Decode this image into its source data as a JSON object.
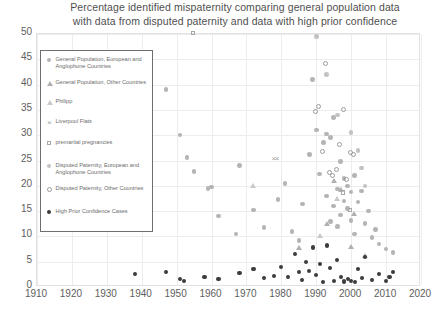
{
  "chart_data": {
    "type": "scatter",
    "title": "Percentage identified mispaternity comparing general population data with data from disputed paternity and data with high prior confidence",
    "title_line1": "Percentage identified mispaternity comparing general population data",
    "title_line2": "with data from disputed paternity and data with high prior confidence",
    "xlabel": "",
    "ylabel": "",
    "xlim": [
      1910,
      2020
    ],
    "ylim": [
      0,
      50
    ],
    "xticks": [
      1910,
      1920,
      1930,
      1940,
      1950,
      1960,
      1970,
      1980,
      1990,
      2000,
      2010,
      2020
    ],
    "yticks": [
      0,
      5,
      10,
      15,
      20,
      25,
      30,
      35,
      40,
      45,
      50
    ],
    "grid": true,
    "legend_position": "upper-left-inside",
    "series": [
      {
        "name": "General Population, European and Anglophone Countries",
        "marker": "filled-circle",
        "color": "#b4b4b4",
        "points": [
          [
            1947,
            39.0
          ],
          [
            1951,
            30.0
          ],
          [
            1953,
            25.6
          ],
          [
            1955,
            22.8
          ],
          [
            1959,
            19.5
          ],
          [
            1960,
            19.8
          ],
          [
            1962,
            14.0
          ],
          [
            1967,
            10.5
          ],
          [
            1968,
            24.0
          ],
          [
            1972,
            15.2
          ],
          [
            1975,
            11.8
          ],
          [
            1979,
            17.3
          ],
          [
            1981,
            20.4
          ],
          [
            1983,
            11.0
          ],
          [
            1985,
            9.2
          ],
          [
            1986,
            16.4
          ],
          [
            1988,
            26.2
          ],
          [
            1989,
            41.0
          ],
          [
            1990,
            31.0
          ],
          [
            1991,
            22.3
          ],
          [
            1992,
            28.5
          ],
          [
            1993,
            30.2
          ],
          [
            1993,
            18.0
          ],
          [
            1994,
            29.5
          ],
          [
            1994,
            13.0
          ],
          [
            1995,
            33.5
          ],
          [
            1995,
            16.0
          ],
          [
            1996,
            19.4
          ],
          [
            1996,
            12.0
          ],
          [
            1997,
            24.8
          ],
          [
            1997,
            14.2
          ],
          [
            1998,
            21.5
          ],
          [
            1998,
            17.0
          ],
          [
            1999,
            20.0
          ],
          [
            1999,
            15.5
          ],
          [
            2000,
            18.8
          ],
          [
            2000,
            13.2
          ],
          [
            2001,
            22.0
          ],
          [
            2001,
            10.5
          ],
          [
            2002,
            16.8
          ],
          [
            2003,
            19.0
          ],
          [
            2004,
            12.5
          ],
          [
            2005,
            15.0
          ],
          [
            2006,
            9.8
          ],
          [
            2007,
            11.4
          ],
          [
            2008,
            8.5
          ],
          [
            2010,
            7.5
          ],
          [
            2012,
            6.8
          ]
        ]
      },
      {
        "name": "General Population, Other Countries",
        "marker": "filled-triangle",
        "color": "#b0b0b0",
        "points": [
          [
            1985,
            7.8
          ],
          [
            1993,
            12.5
          ],
          [
            1995,
            21.0
          ],
          [
            1997,
            19.2
          ],
          [
            2000,
            8.0
          ],
          [
            2001,
            14.5
          ],
          [
            2004,
            6.2
          ]
        ]
      },
      {
        "name": "Philipp",
        "marker": "open-triangle",
        "color": "#c9c9c9",
        "points": [
          [
            1972,
            20.0
          ],
          [
            1991,
            10.2
          ],
          [
            1996,
            17.5
          ]
        ]
      },
      {
        "name": "Liverpool Flats",
        "marker": "x",
        "color": "#9e9e9e",
        "points": [
          [
            1978,
            25.2
          ],
          [
            1979,
            25.2
          ]
        ]
      },
      {
        "name": "premarital pregnancies",
        "marker": "open-square",
        "color": "#a8a8a8",
        "points": [
          [
            1955,
            50.0
          ],
          [
            1998,
            18.5
          ],
          [
            2000,
            15.0
          ]
        ]
      },
      {
        "name": "Disputed Paternity, European and Anglophone Countries",
        "marker": "filled-circle-light",
        "color": "#c2c2c2",
        "points": [
          [
            1990,
            49.5
          ],
          [
            1993,
            42.0
          ],
          [
            1996,
            34.0
          ],
          [
            2000,
            30.5
          ],
          [
            2002,
            27.0
          ],
          [
            2003,
            23.5
          ],
          [
            2004,
            20.0
          ]
        ]
      },
      {
        "name": "Disputed Paternity, Other Countries",
        "marker": "open-circle",
        "color": "#9a9a9a",
        "points": [
          [
            1993,
            44.0
          ],
          [
            1991,
            35.5
          ],
          [
            1990,
            34.5
          ],
          [
            1998,
            34.8
          ],
          [
            1997,
            28.0
          ],
          [
            1996,
            23.0
          ],
          [
            1994,
            22.5
          ],
          [
            1999,
            21.0
          ],
          [
            1992,
            26.5
          ],
          [
            2001,
            26.0
          ],
          [
            2000,
            26.4
          ],
          [
            1995,
            21.8
          ]
        ]
      },
      {
        "name": "High Prior Confidence Cases",
        "marker": "filled-circle-dark",
        "color": "#3c3c3c",
        "points": [
          [
            1938,
            2.5
          ],
          [
            1947,
            3.0
          ],
          [
            1951,
            1.6
          ],
          [
            1952,
            1.2
          ],
          [
            1958,
            2.0
          ],
          [
            1962,
            1.5
          ],
          [
            1968,
            2.8
          ],
          [
            1972,
            3.5
          ],
          [
            1975,
            1.8
          ],
          [
            1978,
            2.2
          ],
          [
            1980,
            4.0
          ],
          [
            1982,
            2.0
          ],
          [
            1984,
            6.5
          ],
          [
            1985,
            3.0
          ],
          [
            1986,
            1.4
          ],
          [
            1987,
            5.0
          ],
          [
            1988,
            3.2
          ],
          [
            1989,
            7.8
          ],
          [
            1990,
            2.4
          ],
          [
            1991,
            4.6
          ],
          [
            1992,
            1.0
          ],
          [
            1993,
            8.2
          ],
          [
            1994,
            3.8
          ],
          [
            1995,
            1.2
          ],
          [
            1996,
            5.4
          ],
          [
            1997,
            2.0
          ],
          [
            1998,
            1.1
          ],
          [
            1999,
            1.5
          ],
          [
            2000,
            1.2
          ],
          [
            2001,
            1.0
          ],
          [
            2002,
            3.6
          ],
          [
            2003,
            1.8
          ],
          [
            2004,
            6.0
          ],
          [
            2006,
            1.4
          ],
          [
            2008,
            2.6
          ],
          [
            2010,
            1.2
          ],
          [
            2011,
            2.0
          ],
          [
            2012,
            3.0
          ]
        ]
      }
    ]
  }
}
